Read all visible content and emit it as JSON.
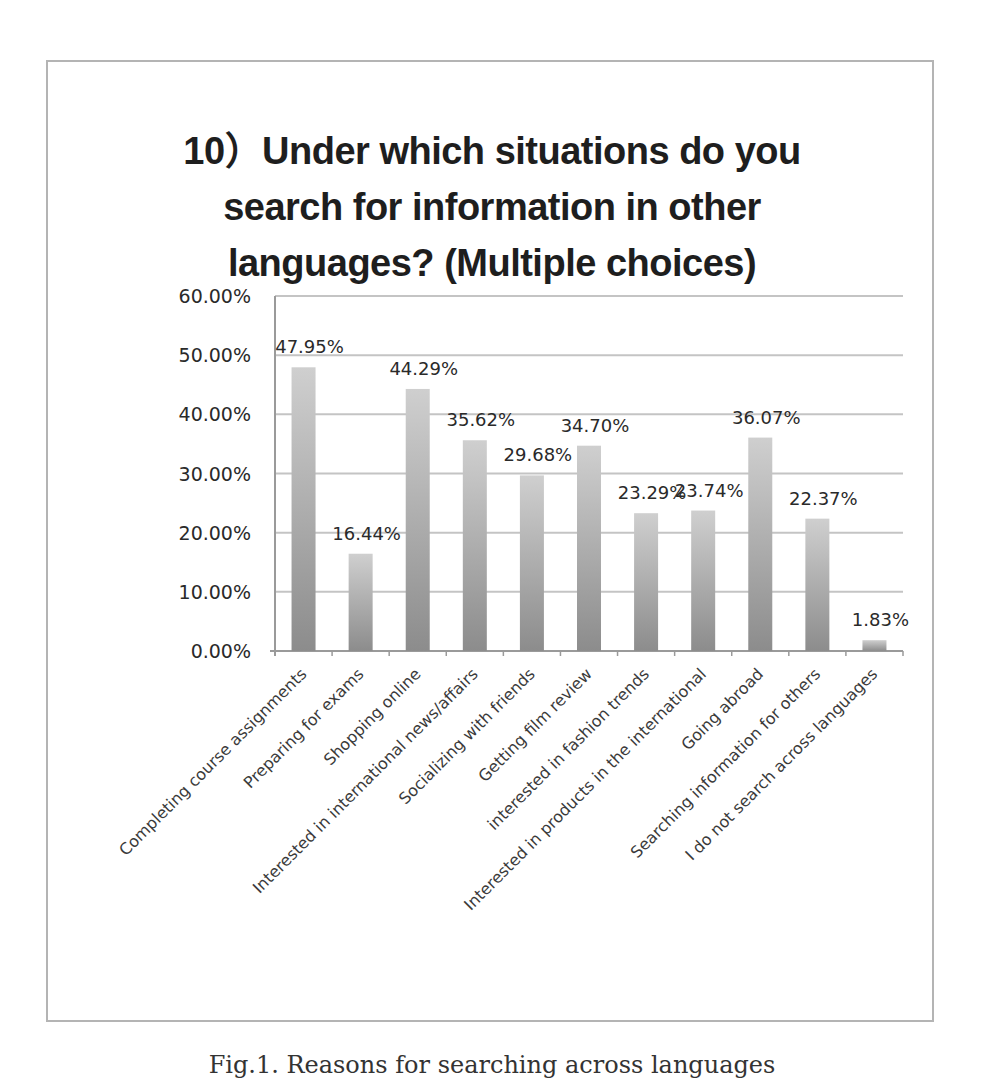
{
  "figure": {
    "title_lines": [
      "10）Under which situations do you",
      "search for information in other",
      "languages? (Multiple choices)"
    ],
    "caption": "Fig.1. Reasons for searching across languages"
  },
  "colors": {
    "bar_top": "#cfcfcf",
    "bar_bottom": "#8c8c8c",
    "gridline": "#c4c4c4",
    "axis": "#9a9a9a",
    "text": "#2a2a2a",
    "frame": "#b4b4b4"
  },
  "chart_data": {
    "type": "bar",
    "xlabel": "",
    "ylabel": "",
    "ylim": [
      0,
      60
    ],
    "yticks": [
      "0.00%",
      "10.00%",
      "20.00%",
      "30.00%",
      "40.00%",
      "50.00%",
      "60.00%"
    ],
    "grid": true,
    "legend": "none",
    "categories": [
      "Completing course assignments",
      "Preparing for exams",
      "Shopping online",
      "Interested in international news/affairs",
      "Socializing with friends",
      "Getting film review",
      "interested in fashion trends",
      "Interested in products in the international",
      "Going abroad",
      "Searching information for others",
      "I do not search across languages"
    ],
    "values": [
      47.95,
      16.44,
      44.29,
      35.62,
      29.68,
      34.7,
      23.29,
      23.74,
      36.07,
      22.37,
      1.83
    ],
    "data_labels": [
      "47.95%",
      "16.44%",
      "44.29%",
      "35.62%",
      "29.68%",
      "34.70%",
      "23.29%",
      "23.74%",
      "36.07%",
      "22.37%",
      "1.83%"
    ]
  }
}
